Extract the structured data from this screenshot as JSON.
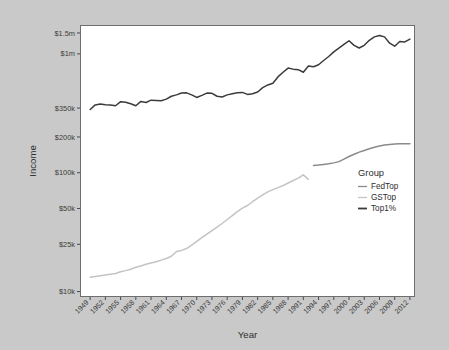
{
  "chart_data": {
    "type": "line",
    "title": "",
    "xlabel": "Year",
    "ylabel": "Income",
    "yscale": "log",
    "ylim": [
      9000,
      1750000
    ],
    "xlim": [
      1947,
      2013
    ],
    "grid": false,
    "legend": {
      "title": "Group",
      "position": "inside-right",
      "entries": [
        {
          "name": "FedTop",
          "color": "#8a8a8a"
        },
        {
          "name": "GSTop",
          "color": "#c4c4c4"
        },
        {
          "name": "Top1%",
          "color": "#3b3b3b"
        }
      ]
    },
    "y_ticks": [
      {
        "value": 10000,
        "label": "$10k"
      },
      {
        "value": 25000,
        "label": "$25k"
      },
      {
        "value": 50000,
        "label": "$50k"
      },
      {
        "value": 100000,
        "label": "$100k"
      },
      {
        "value": 200000,
        "label": "$200k"
      },
      {
        "value": 350000,
        "label": "$350k"
      },
      {
        "value": 1000000,
        "label": "$1m"
      },
      {
        "value": 1500000,
        "label": "$1.5m"
      }
    ],
    "x_ticks": [
      {
        "value": 1949,
        "label": "1949"
      },
      {
        "value": 1952,
        "label": "1952"
      },
      {
        "value": 1955,
        "label": "1955"
      },
      {
        "value": 1958,
        "label": "1958"
      },
      {
        "value": 1961,
        "label": "1961"
      },
      {
        "value": 1964,
        "label": "1964"
      },
      {
        "value": 1967,
        "label": "1967"
      },
      {
        "value": 1970,
        "label": "1970"
      },
      {
        "value": 1973,
        "label": "1973"
      },
      {
        "value": 1976,
        "label": "1976"
      },
      {
        "value": 1979,
        "label": "1979"
      },
      {
        "value": 1982,
        "label": "1982"
      },
      {
        "value": 1985,
        "label": "1985"
      },
      {
        "value": 1988,
        "label": "1988"
      },
      {
        "value": 1991,
        "label": "1991"
      },
      {
        "value": 1994,
        "label": "1994"
      },
      {
        "value": 1997,
        "label": "1997"
      },
      {
        "value": 2000,
        "label": "2000"
      },
      {
        "value": 2003,
        "label": "2003"
      },
      {
        "value": 2006,
        "label": "2006"
      },
      {
        "value": 2009,
        "label": "2009"
      },
      {
        "value": 2012,
        "label": "2012"
      }
    ],
    "series": [
      {
        "name": "Top1%",
        "color": "#3b3b3b",
        "width": 1.5,
        "x": [
          1949,
          1950,
          1951,
          1952,
          1953,
          1954,
          1955,
          1956,
          1957,
          1958,
          1959,
          1960,
          1961,
          1962,
          1963,
          1964,
          1965,
          1966,
          1967,
          1968,
          1969,
          1970,
          1971,
          1972,
          1973,
          1974,
          1975,
          1976,
          1977,
          1978,
          1979,
          1980,
          1981,
          1982,
          1983,
          1984,
          1985,
          1986,
          1987,
          1988,
          1989,
          1990,
          1991,
          1992,
          1993,
          1994,
          1995,
          1996,
          1997,
          1998,
          1999,
          2000,
          2001,
          2002,
          2003,
          2004,
          2005,
          2006,
          2007,
          2008,
          2009,
          2010,
          2011,
          2012
        ],
        "y": [
          340000,
          372000,
          378000,
          374000,
          372000,
          366000,
          396000,
          392000,
          380000,
          366000,
          398000,
          390000,
          408000,
          406000,
          404000,
          416000,
          440000,
          452000,
          468000,
          470000,
          452000,
          430000,
          448000,
          468000,
          466000,
          440000,
          434000,
          452000,
          462000,
          470000,
          474000,
          456000,
          462000,
          478000,
          520000,
          548000,
          566000,
          640000,
          700000,
          760000,
          744000,
          736000,
          700000,
          790000,
          780000,
          810000,
          880000,
          950000,
          1040000,
          1120000,
          1200000,
          1290000,
          1180000,
          1120000,
          1180000,
          1300000,
          1390000,
          1430000,
          1390000,
          1230000,
          1160000,
          1270000,
          1260000,
          1330000
        ]
      },
      {
        "name": "GSTop",
        "color": "#c4c4c4",
        "width": 1.5,
        "x": [
          1949,
          1950,
          1951,
          1952,
          1953,
          1954,
          1955,
          1956,
          1957,
          1958,
          1959,
          1960,
          1961,
          1962,
          1963,
          1964,
          1965,
          1966,
          1967,
          1968,
          1969,
          1970,
          1971,
          1972,
          1973,
          1974,
          1975,
          1976,
          1977,
          1978,
          1979,
          1980,
          1981,
          1982,
          1983,
          1984,
          1985,
          1986,
          1987,
          1988,
          1989,
          1990,
          1991,
          1992
        ],
        "y": [
          13200,
          13400,
          13600,
          13800,
          14000,
          14200,
          14700,
          15000,
          15400,
          16000,
          16400,
          17000,
          17400,
          17800,
          18400,
          19000,
          19800,
          21700,
          22200,
          23000,
          24600,
          26400,
          28400,
          30400,
          32600,
          34800,
          37400,
          40400,
          43600,
          47000,
          50400,
          53000,
          57000,
          61000,
          65000,
          69000,
          72000,
          75000,
          78000,
          82000,
          86000,
          90000,
          96000,
          88000
        ]
      },
      {
        "name": "FedTop",
        "color": "#8a8a8a",
        "width": 1.5,
        "x": [
          1993,
          1994,
          1995,
          1996,
          1997,
          1998,
          1999,
          2000,
          2001,
          2002,
          2003,
          2004,
          2005,
          2006,
          2007,
          2008,
          2009,
          2010,
          2011,
          2012
        ],
        "y": [
          115000,
          116000,
          117500,
          119000,
          121000,
          124000,
          130000,
          137000,
          143000,
          149000,
          154000,
          159000,
          164000,
          168000,
          171000,
          173000,
          174500,
          175000,
          175000,
          175000
        ]
      }
    ]
  },
  "plot": {
    "panel": {
      "x": 80,
      "y": 25,
      "width": 335,
      "height": 272
    }
  }
}
